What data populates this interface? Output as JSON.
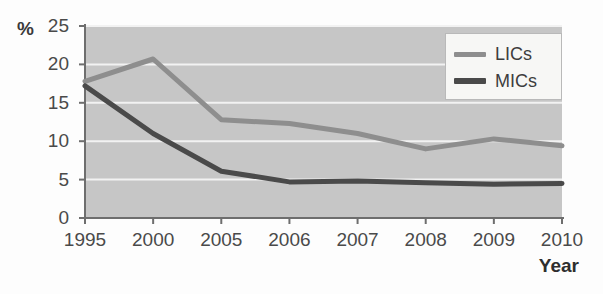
{
  "chart_data": {
    "type": "line",
    "title": "",
    "xlabel": "Year",
    "ylabel": "%",
    "categories": [
      "1995",
      "2000",
      "2005",
      "2006",
      "2007",
      "2008",
      "2009",
      "2010"
    ],
    "series": [
      {
        "name": "LICs",
        "color": "#8e8e8e",
        "values": [
          17.8,
          20.7,
          12.8,
          12.3,
          11.0,
          9.0,
          10.3,
          9.4
        ]
      },
      {
        "name": "MICs",
        "color": "#4a4a4a",
        "values": [
          17.2,
          11.0,
          6.1,
          4.7,
          4.8,
          4.6,
          4.4,
          4.5
        ]
      }
    ],
    "ylim": [
      0,
      25
    ],
    "yticks": [
      0,
      5,
      10,
      15,
      20,
      25
    ],
    "ytick_labels": [
      "0",
      "5",
      "10",
      "15",
      "20",
      "25"
    ],
    "grid": "horizontal",
    "grid_color": "#f2f2f2",
    "plot_background": "#c6c6c6",
    "axis_color": "#6e6e6e",
    "legend_position": "top-right"
  },
  "legend": {
    "entries": [
      {
        "label": "LICs"
      },
      {
        "label": "MICs"
      }
    ]
  },
  "axes": {
    "y_unit_label": "%",
    "x_title": "Year"
  }
}
